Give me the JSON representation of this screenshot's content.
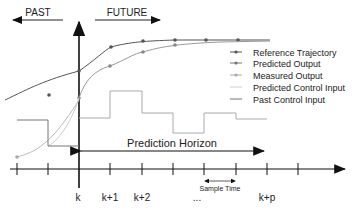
{
  "labels": {
    "past": "PAST",
    "future": "FUTURE",
    "prediction_horizon": "Prediction Horizon",
    "sample_time": "Sample Time"
  },
  "axis": {
    "ticks": [
      "k",
      "k+1",
      "k+2",
      "...",
      "k+p"
    ]
  },
  "legend": [
    {
      "label": "Reference Trajectory",
      "color": "#555555",
      "marker": true
    },
    {
      "label": "Predicted Output",
      "color": "#777777",
      "marker": true
    },
    {
      "label": "Measured Output",
      "color": "#aaaaaa",
      "marker": true
    },
    {
      "label": "Predicted Control Input",
      "color": "#d0d0d0",
      "marker": false
    },
    {
      "label": "Past Control Input",
      "color": "#777777",
      "marker": false
    }
  ]
}
